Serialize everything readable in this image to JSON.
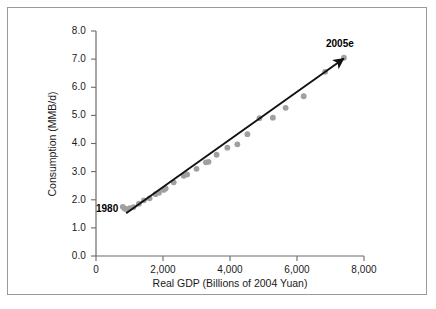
{
  "chart_data": {
    "type": "scatter",
    "title": "",
    "xlabel": "Real GDP (Billions of 2004 Yuan)",
    "ylabel": "Consumption (MMB/d)",
    "xlim": [
      0,
      8000
    ],
    "ylim": [
      0,
      8.0
    ],
    "grid": false,
    "legend": null,
    "x_ticks": [
      "0",
      "2,000",
      "4,000",
      "6,000",
      "8,000"
    ],
    "x_tick_values": [
      0,
      2000,
      4000,
      6000,
      8000
    ],
    "y_ticks": [
      "0.0",
      "1.0",
      "2.0",
      "3.0",
      "4.0",
      "5.0",
      "6.0",
      "7.0",
      "8.0"
    ],
    "y_tick_values": [
      0.0,
      1.0,
      2.0,
      3.0,
      4.0,
      5.0,
      6.0,
      7.0,
      8.0
    ],
    "series": [
      {
        "name": "China oil consumption vs real GDP",
        "marker": "circle",
        "color": "#a0a0a0",
        "x": [
          800,
          860,
          930,
          1010,
          1120,
          1280,
          1430,
          1600,
          1780,
          1880,
          2020,
          2080,
          2320,
          2620,
          2720,
          3000,
          3280,
          3360,
          3600,
          3920,
          4220,
          4520,
          4880,
          5280,
          5660,
          6200,
          6840,
          7400
        ],
        "y": [
          1.75,
          1.68,
          1.66,
          1.7,
          1.74,
          1.86,
          1.98,
          2.05,
          2.2,
          2.25,
          2.35,
          2.4,
          2.62,
          2.85,
          2.9,
          3.1,
          3.33,
          3.35,
          3.6,
          3.85,
          3.97,
          4.33,
          4.9,
          4.92,
          5.27,
          5.68,
          6.55,
          7.05
        ]
      }
    ],
    "trendline": {
      "name": "fitted trend",
      "color": "#111111",
      "arrowhead": true,
      "x_start": 900,
      "y_start": 1.52,
      "x_end": 7400,
      "y_end": 7.02
    },
    "annotations": [
      {
        "id": "start-year",
        "text": "1980",
        "bold": true
      },
      {
        "id": "end-year",
        "text": "2005e",
        "bold": true
      }
    ]
  },
  "axes": {
    "y_label": "Consumption (MMB/d)",
    "x_label": "Real GDP (Billions of 2004 Yuan)",
    "y_tick_labels": [
      "8.0",
      "7.0",
      "6.0",
      "5.0",
      "4.0",
      "3.0",
      "2.0",
      "1.0",
      "0.0"
    ],
    "x_tick_labels": [
      "0",
      "2,000",
      "4,000",
      "6,000",
      "8,000"
    ]
  },
  "annotations": {
    "start_label": "1980",
    "end_label": "2005e"
  },
  "colors": {
    "marker": "#a0a0a0",
    "trendline": "#111111",
    "axis": "#6b6b6b",
    "frame": "#9a9a9a",
    "text": "#1a1a1a"
  }
}
